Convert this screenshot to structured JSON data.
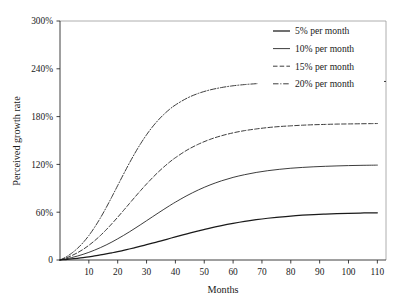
{
  "chart_data": {
    "type": "line",
    "title": "",
    "subtitle": "",
    "xlabel": "Months",
    "ylabel": "Perceived growth rate",
    "xlim": [
      0,
      113
    ],
    "ylim": [
      0,
      300
    ],
    "grid": false,
    "legend_position": "top-right",
    "x_ticks": [
      10,
      20,
      30,
      40,
      50,
      60,
      70,
      80,
      90,
      100,
      110
    ],
    "x_tick_labels": [
      "10",
      "20",
      "30",
      "40",
      "50",
      "60",
      "70",
      "80",
      "90",
      "100",
      "110"
    ],
    "y_ticks": [
      0,
      60,
      120,
      180,
      240,
      300
    ],
    "y_tick_labels": [
      "0",
      "60%",
      "120%",
      "180%",
      "240%",
      "300%"
    ],
    "x": [
      0,
      2,
      4,
      6,
      8,
      10,
      12,
      14,
      16,
      18,
      20,
      22,
      24,
      26,
      28,
      30,
      32,
      34,
      36,
      38,
      40,
      44,
      48,
      52,
      56,
      60,
      64,
      68,
      72,
      76,
      80,
      84,
      88,
      92,
      96,
      100,
      104,
      108,
      110
    ],
    "series": [
      {
        "name": "5% per month",
        "label": "5% per month",
        "linestyle": "solid",
        "color": "#1a1a1a",
        "asymptote": 60,
        "values": [
          0,
          0.6,
          1.3,
          2.1,
          3.0,
          4.0,
          5.1,
          6.3,
          7.6,
          9.0,
          10.5,
          12.1,
          13.8,
          15.5,
          17.3,
          19.2,
          21.1,
          23.0,
          25.0,
          27.0,
          29.0,
          32.9,
          36.6,
          40.1,
          43.2,
          46.0,
          48.5,
          50.6,
          52.4,
          53.9,
          55.2,
          56.2,
          57.0,
          57.7,
          58.2,
          58.6,
          58.9,
          59.2,
          59.3
        ]
      },
      {
        "name": "10% per month",
        "label": "10% per month",
        "linestyle": "solid",
        "color": "#1a1a1a",
        "asymptote": 120,
        "values": [
          0,
          1.4,
          3.0,
          4.9,
          7.1,
          9.6,
          12.4,
          15.5,
          18.9,
          22.6,
          26.6,
          30.8,
          35.2,
          39.8,
          44.5,
          49.3,
          54.1,
          58.9,
          63.6,
          68.2,
          72.6,
          80.8,
          88.0,
          94.2,
          99.4,
          103.7,
          107.1,
          109.9,
          112.1,
          113.8,
          115.2,
          116.2,
          117.0,
          117.6,
          118.1,
          118.5,
          118.8,
          119.0,
          119.1
        ]
      },
      {
        "name": "15% per month",
        "label": "15% per month",
        "linestyle": "dashed",
        "color": "#1a1a1a",
        "asymptote": 180,
        "values": [
          0,
          2.4,
          5.4,
          9.0,
          13.3,
          18.4,
          24.2,
          30.7,
          37.9,
          45.6,
          53.7,
          62.1,
          70.6,
          79.1,
          87.4,
          95.4,
          103.0,
          110.2,
          116.8,
          122.9,
          128.4,
          137.9,
          145.4,
          151.4,
          156.0,
          159.6,
          162.4,
          164.5,
          166.2,
          167.5,
          168.4,
          169.2,
          169.8,
          170.2,
          170.6,
          170.8,
          171.0,
          171.2,
          171.3
        ]
      },
      {
        "name": "20% per month",
        "label": "20% per month",
        "linestyle": "dash-dot",
        "color": "#1a1a1a",
        "asymptote": 240,
        "values": [
          0,
          3.6,
          8.4,
          14.4,
          21.8,
          30.7,
          41.1,
          52.8,
          65.7,
          79.4,
          93.5,
          107.6,
          121.3,
          134.3,
          146.3,
          157.2,
          166.9,
          175.4,
          182.8,
          189.2,
          194.6,
          203.1,
          209.2,
          213.5,
          216.5,
          218.7,
          220.2,
          221.3,
          222.1,
          222.7,
          223.1,
          223.4,
          223.6,
          223.8,
          223.9,
          224.0,
          224.0,
          224.1,
          224.1
        ]
      }
    ],
    "legend_items": [
      {
        "label": "5% per month",
        "linestyle": "solid"
      },
      {
        "label": "10% per month",
        "linestyle": "solid"
      },
      {
        "label": "15% per month",
        "linestyle": "dashed"
      },
      {
        "label": "20% per month",
        "linestyle": "dash-dot"
      }
    ]
  }
}
